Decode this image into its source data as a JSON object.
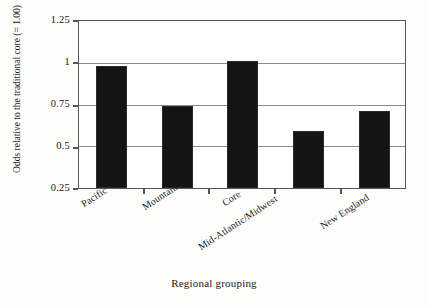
{
  "chart_data": {
    "type": "bar",
    "title": "",
    "subtitle": "",
    "xlabel": "Regional grouping",
    "ylabel": "Odds relative to the traditional core (= 1.00)",
    "categories": [
      "Pacific",
      "Mountain",
      "Core",
      "Mid-Atlantic/Midwest",
      "New England"
    ],
    "values": [
      0.98,
      0.74,
      1.01,
      0.59,
      0.71
    ],
    "ylim": [
      0.25,
      1.25
    ],
    "ytick_labels": [
      "0.25",
      "0.5",
      "0.75",
      "1",
      "1.25"
    ],
    "ytick_values": [
      0.25,
      0.5,
      0.75,
      1,
      1.25
    ],
    "grid": "horizontal",
    "legend": "none",
    "bar_color": "#141414",
    "frame_color": "#555555",
    "gridline_color": "#8a8a8a",
    "background": "#ffffff"
  },
  "axes": {
    "y": {
      "title": "Odds relative to the traditional core (= 1.00)",
      "ticks": [
        {
          "label": "1.25",
          "value": 1.25
        },
        {
          "label": "1",
          "value": 1
        },
        {
          "label": "0.75",
          "value": 0.75
        },
        {
          "label": "0.5",
          "value": 0.5
        },
        {
          "label": "0.25",
          "value": 0.25
        }
      ]
    },
    "x": {
      "title": "Regional grouping",
      "categories": [
        {
          "label": "Pacific"
        },
        {
          "label": "Mountain"
        },
        {
          "label": "Core"
        },
        {
          "label": "Mid-Atlantic/Midwest"
        },
        {
          "label": "New England"
        }
      ]
    }
  }
}
